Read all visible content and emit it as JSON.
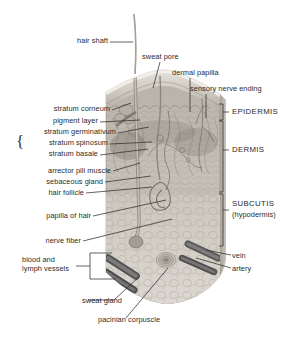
{
  "figure": {
    "background_color": "#ffffff",
    "text_color": "#2b2b2b",
    "width": 298,
    "height": 342
  },
  "labels_left": [
    {
      "id": "hair-shaft",
      "text": "hair shaft",
      "x": 76,
      "y": 40,
      "line": [
        80,
        44,
        131,
        44
      ]
    },
    {
      "id": "stratum-corneum",
      "text": "stratum corneum",
      "x": 95,
      "y": 108,
      "line": [
        99,
        112,
        131,
        106
      ]
    },
    {
      "id": "pigment-layer",
      "text": "pigment layer",
      "x": 83,
      "y": 120,
      "line": [
        87,
        124,
        139,
        124
      ]
    },
    {
      "id": "stratum-germinativum",
      "text": "stratum germinativum",
      "x": 105,
      "y": 131,
      "line": [
        109,
        135,
        144,
        130
      ]
    },
    {
      "id": "stratum-spinosum",
      "text": "stratum spinosum",
      "x": 92,
      "y": 142,
      "line": [
        96,
        146,
        148,
        144
      ]
    },
    {
      "id": "stratum-basale",
      "text": "stratum basale",
      "x": 80,
      "y": 153,
      "line": [
        84,
        157,
        145,
        150
      ]
    },
    {
      "id": "arrector-pili-muscle",
      "text": "arrector pili muscle",
      "x": 100,
      "y": 170,
      "line": [
        104,
        174,
        140,
        165
      ]
    },
    {
      "id": "sebaceous-gland",
      "text": "sebaceous gland",
      "x": 91,
      "y": 181,
      "line": [
        95,
        185,
        148,
        180
      ]
    },
    {
      "id": "hair-follicle",
      "text": "hair follicle",
      "x": 70,
      "y": 192,
      "line": [
        74,
        196,
        150,
        190
      ]
    },
    {
      "id": "papilla-of-hair",
      "text": "papilla of hair",
      "x": 76,
      "y": 215,
      "line": [
        80,
        219,
        160,
        203
      ]
    },
    {
      "id": "nerve-fiber",
      "text": "nerve fiber",
      "x": 66,
      "y": 240,
      "line": [
        70,
        244,
        168,
        222
      ]
    },
    {
      "id": "blood-lymph-1",
      "text": "blood and",
      "x": 57,
      "y": 258,
      "line": null
    },
    {
      "id": "blood-lymph-2",
      "text": "lymph vessels",
      "x": 71,
      "y": 267,
      "line": [
        75,
        264,
        88,
        264
      ]
    },
    {
      "id": "sweat-gland",
      "text": "sweat gland",
      "x": 125,
      "y": 303,
      "line": [
        108,
        301,
        135,
        278
      ]
    },
    {
      "id": "pacinian-corpuscle",
      "text": "pacinian corpuscle",
      "x": 167,
      "y": 322,
      "line": [
        126,
        319,
        160,
        272
      ]
    }
  ],
  "labels_top": [
    {
      "id": "sweat-pore",
      "text": "sweat pore",
      "x": 142,
      "y": 56,
      "line": [
        163,
        62,
        158,
        89
      ]
    },
    {
      "id": "dermal-papilla",
      "text": "dermal papilla",
      "x": 172,
      "y": 72,
      "line": [
        185,
        78,
        185,
        113
      ]
    },
    {
      "id": "sensory-nerve-ending",
      "text": "sensory nerve ending",
      "x": 191,
      "y": 88,
      "line": [
        203,
        94,
        203,
        118
      ]
    }
  ],
  "labels_right": [
    {
      "id": "epidermis",
      "text": "EPIDERMIS",
      "x": 233,
      "y": 110
    },
    {
      "id": "dermis",
      "text": "DERMIS",
      "x": 233,
      "y": 148
    },
    {
      "id": "subcutis",
      "text": "SUBCUTIS",
      "x": 233,
      "y": 203
    },
    {
      "id": "hypodermis",
      "text": "(hypodermis)",
      "x": 233,
      "y": 214
    },
    {
      "id": "vein",
      "text": "vein",
      "x": 233,
      "y": 256
    },
    {
      "id": "artery",
      "text": "artery",
      "x": 233,
      "y": 269
    }
  ],
  "brackets": {
    "stratum_group": "{",
    "epidermis_range": [
      104,
      120
    ],
    "dermis_range": [
      120,
      193
    ],
    "subcutis_range": [
      193,
      245
    ],
    "blood_lymph_range": [
      252,
      280
    ]
  },
  "colors": {
    "ink": "#2b2b2b",
    "leader": "#2f2f2f",
    "epidermis_tone": "#cfcbc4",
    "dermis_tone": "#b9b4ac",
    "subcutis_tone": "#d6d2cb",
    "vessel_dark": "#5a5a5a",
    "hair_tone": "#9d988f"
  }
}
